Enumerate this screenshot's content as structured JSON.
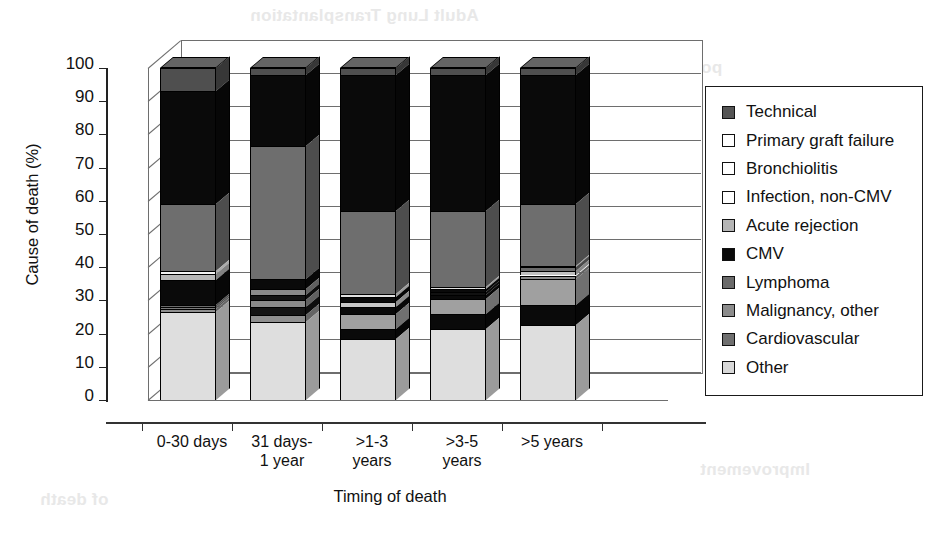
{
  "chart_data": {
    "type": "bar",
    "subtype": "stacked-bar-3d",
    "title": "",
    "xlabel": "Timing of death",
    "ylabel": "Cause of death (%)",
    "ylim": [
      0,
      100
    ],
    "yticks": [
      0,
      10,
      20,
      30,
      40,
      50,
      60,
      70,
      80,
      90,
      100
    ],
    "ytick_labels": [
      "0",
      "10",
      "20",
      "30",
      "40",
      "50",
      "60",
      "70",
      "80",
      "90",
      "100"
    ],
    "grid": true,
    "legend_position": "right",
    "categories": [
      "0-30 days",
      "31 days-\n1 year",
      ">1-3\nyears",
      ">3-5\nyears",
      ">5 years"
    ],
    "category_labels": [
      {
        "line1": "0-30 days",
        "line2": ""
      },
      {
        "line1": "31 days-",
        "line2": "1 year"
      },
      {
        "line1": ">1-3",
        "line2": "years"
      },
      {
        "line1": ">3-5",
        "line2": "years"
      },
      {
        "line1": ">5 years",
        "line2": ""
      }
    ],
    "stack_order_bottom_to_top": [
      "Other",
      "Cardiovascular",
      "Malignancy, other",
      "Lymphoma",
      "CMV",
      "Acute rejection",
      "Infection, non-CMV",
      "Bronchiolitis",
      "Primary graft failure",
      "Technical"
    ],
    "series": [
      {
        "name": "Technical",
        "color": "#555555",
        "values": [
          6,
          2,
          2,
          2,
          2
        ]
      },
      {
        "name": "Primary graft failure",
        "color": "#ffffff",
        "values": [
          0,
          1,
          0,
          0,
          0
        ]
      },
      {
        "name": "Bronchiolitis",
        "color": "#fcfcfc",
        "values": [
          0,
          0,
          0,
          0,
          0
        ]
      },
      {
        "name": "Infection, non-CMV",
        "color": "#fcfcfc",
        "values": [
          0,
          0,
          0,
          0,
          0
        ]
      },
      {
        "name": "Acute rejection",
        "color": "#b5b5b5",
        "values": [
          30,
          21,
          41,
          41,
          37
        ]
      },
      {
        "name": "CMV",
        "color": "#0a0a0a",
        "values": [
          0,
          0,
          0,
          0,
          0
        ]
      },
      {
        "name": "Lymphoma",
        "color": "#6a6a6a",
        "values": [
          21,
          53,
          24,
          23,
          17
        ]
      },
      {
        "name": "Malignancy, other",
        "color": "#7d7d7d",
        "values": [
          2,
          2,
          3,
          3,
          3
        ]
      },
      {
        "name": "Cardiovascular",
        "color": "#8a8a8a",
        "values": [
          6,
          6,
          6,
          5,
          5
        ]
      },
      {
        "name": "Other",
        "color": "#d8d8d8",
        "values": [
          27,
          24,
          19,
          22,
          23
        ]
      }
    ],
    "bars": [
      {
        "category": "0-30 days",
        "segments": [
          {
            "label": "Other",
            "value": 26.5,
            "color": "#dedede"
          },
          {
            "label": "Cardiovascular",
            "value": 1.0,
            "color": "#8f8f8f"
          },
          {
            "label": "Malignancy, other",
            "value": 0.6,
            "color": "#7a7a7a"
          },
          {
            "label": "Lymphoma",
            "value": 0.4,
            "color": "#6a6a6a"
          },
          {
            "label": "CMV",
            "value": 7.5,
            "color": "#0a0a0a"
          },
          {
            "label": "Acute rejection",
            "value": 2.0,
            "color": "#b8b8b8"
          },
          {
            "label": "Infection, non-CMV",
            "value": 1.0,
            "color": "#f4f4f4"
          },
          {
            "label": "Bronchiolitis",
            "value": 20.0,
            "color": "#6e6e6e"
          },
          {
            "label": "Primary graft failure",
            "value": 34.0,
            "color": "#0a0a0a"
          },
          {
            "label": "Technical",
            "value": 7.0,
            "color": "#4f4f4f"
          }
        ]
      },
      {
        "category": "31 days-1 year",
        "segments": [
          {
            "label": "Other",
            "value": 23.5,
            "color": "#dedede"
          },
          {
            "label": "Cardiovascular",
            "value": 2.0,
            "color": "#8f8f8f"
          },
          {
            "label": "Malignancy, other",
            "value": 2.5,
            "color": "#141414"
          },
          {
            "label": "Lymphoma",
            "value": 2.0,
            "color": "#8a8a8a"
          },
          {
            "label": "CMV",
            "value": 1.5,
            "color": "#141414"
          },
          {
            "label": "Acute rejection",
            "value": 2.0,
            "color": "#8a8a8a"
          },
          {
            "label": "Infection, non-CMV",
            "value": 3.0,
            "color": "#0a0a0a"
          },
          {
            "label": "Bronchiolitis",
            "value": 40.0,
            "color": "#6e6e6e"
          },
          {
            "label": "Primary graft failure",
            "value": 21.5,
            "color": "#0a0a0a"
          },
          {
            "label": "Technical",
            "value": 2.0,
            "color": "#4f4f4f"
          }
        ]
      },
      {
        "category": ">1-3 years",
        "segments": [
          {
            "label": "Other",
            "value": 18.5,
            "color": "#dedede"
          },
          {
            "label": "Cardiovascular",
            "value": 3.0,
            "color": "#0a0a0a"
          },
          {
            "label": "Malignancy, other",
            "value": 4.5,
            "color": "#a0a0a0"
          },
          {
            "label": "Lymphoma",
            "value": 2.0,
            "color": "#0a0a0a"
          },
          {
            "label": "CMV",
            "value": 1.5,
            "color": "#c8c8c8"
          },
          {
            "label": "Acute rejection",
            "value": 1.5,
            "color": "#0a0a0a"
          },
          {
            "label": "Infection, non-CMV",
            "value": 1.0,
            "color": "#e0e0e0"
          },
          {
            "label": "Bronchiolitis",
            "value": 25.0,
            "color": "#6e6e6e"
          },
          {
            "label": "Primary graft failure",
            "value": 41.0,
            "color": "#0a0a0a"
          },
          {
            "label": "Technical",
            "value": 2.0,
            "color": "#4f4f4f"
          }
        ]
      },
      {
        "category": ">3-5 years",
        "segments": [
          {
            "label": "Other",
            "value": 21.5,
            "color": "#dedede"
          },
          {
            "label": "Cardiovascular",
            "value": 4.5,
            "color": "#0a0a0a"
          },
          {
            "label": "Malignancy, other",
            "value": 4.5,
            "color": "#a0a0a0"
          },
          {
            "label": "Lymphoma",
            "value": 1.0,
            "color": "#0a0a0a"
          },
          {
            "label": "CMV",
            "value": 1.0,
            "color": "#111111"
          },
          {
            "label": "Acute rejection",
            "value": 1.0,
            "color": "#0a0a0a"
          },
          {
            "label": "Infection, non-CMV",
            "value": 0.5,
            "color": "#e0e0e0"
          },
          {
            "label": "Bronchiolitis",
            "value": 23.0,
            "color": "#6e6e6e"
          },
          {
            "label": "Primary graft failure",
            "value": 41.0,
            "color": "#0a0a0a"
          },
          {
            "label": "Technical",
            "value": 2.0,
            "color": "#4f4f4f"
          }
        ]
      },
      {
        "category": ">5 years",
        "segments": [
          {
            "label": "Other",
            "value": 22.5,
            "color": "#dedede"
          },
          {
            "label": "Cardiovascular",
            "value": 6.0,
            "color": "#0a0a0a"
          },
          {
            "label": "Malignancy, other",
            "value": 8.0,
            "color": "#a0a0a0"
          },
          {
            "label": "Lymphoma",
            "value": 1.0,
            "color": "#8a8a8a"
          },
          {
            "label": "CMV",
            "value": 1.5,
            "color": "#c0c0c0"
          },
          {
            "label": "Acute rejection",
            "value": 1.0,
            "color": "#6a6a6a"
          },
          {
            "label": "Infection, non-CMV",
            "value": 0.5,
            "color": "#e0e0e0"
          },
          {
            "label": "Bronchiolitis",
            "value": 18.5,
            "color": "#6e6e6e"
          },
          {
            "label": "Primary graft failure",
            "value": 39.0,
            "color": "#0a0a0a"
          },
          {
            "label": "Technical",
            "value": 2.0,
            "color": "#4f4f4f"
          }
        ]
      }
    ]
  },
  "legend": {
    "items": [
      {
        "label": "Technical",
        "color": "#555555"
      },
      {
        "label": "Primary graft failure",
        "color": "#ffffff"
      },
      {
        "label": "Bronchiolitis",
        "color": "#ffffff"
      },
      {
        "label": "Infection, non-CMV",
        "color": "#ffffff"
      },
      {
        "label": "Acute rejection",
        "color": "#b5b5b5"
      },
      {
        "label": "CMV",
        "color": "#0a0a0a"
      },
      {
        "label": "Lymphoma",
        "color": "#6a6a6a"
      },
      {
        "label": "Malignancy, other",
        "color": "#8c8c8c"
      },
      {
        "label": "Cardiovascular",
        "color": "#6f6f6f"
      },
      {
        "label": "Other",
        "color": "#d8d8d8"
      }
    ]
  },
  "background_ghost_text": [
    {
      "text": "Adult Lung Transplantation",
      "x": 250,
      "y": 6
    },
    {
      "text": "posttransplant",
      "x": 600,
      "y": 58
    },
    {
      "text": "and",
      "x": 520,
      "y": 95
    },
    {
      "text": "Survival",
      "x": 300,
      "y": 215
    },
    {
      "text": "the",
      "x": 330,
      "y": 345
    },
    {
      "text": "Improvement",
      "x": 700,
      "y": 460
    },
    {
      "text": "of death",
      "x": 40,
      "y": 490
    }
  ]
}
